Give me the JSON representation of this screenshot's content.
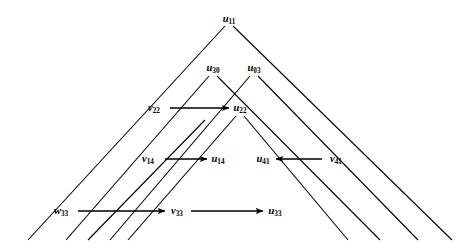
{
  "figure": {
    "type": "lattice-diagram",
    "background": "#ffffff",
    "stroke": "#000000",
    "width": 468,
    "height": 248
  },
  "nodes": [
    {
      "id": "u11",
      "base": "u",
      "sub": "11",
      "x": 229,
      "y": 19,
      "anchor": "center"
    },
    {
      "id": "u30",
      "base": "u",
      "sub": "30",
      "x": 213,
      "y": 68,
      "anchor": "center"
    },
    {
      "id": "u03",
      "base": "u",
      "sub": "03",
      "x": 254,
      "y": 68,
      "anchor": "center"
    },
    {
      "id": "v22",
      "base": "v",
      "sub": "22",
      "x": 154,
      "y": 108,
      "anchor": "center"
    },
    {
      "id": "u22",
      "base": "u",
      "sub": "22",
      "x": 240,
      "y": 108,
      "anchor": "center"
    },
    {
      "id": "v14",
      "base": "v",
      "sub": "14",
      "x": 148,
      "y": 159,
      "anchor": "center"
    },
    {
      "id": "u14",
      "base": "u",
      "sub": "14",
      "x": 218,
      "y": 159,
      "anchor": "center"
    },
    {
      "id": "u41",
      "base": "u",
      "sub": "41",
      "x": 263,
      "y": 159,
      "anchor": "center"
    },
    {
      "id": "v41",
      "base": "v",
      "sub": "41",
      "x": 336,
      "y": 159,
      "anchor": "center"
    },
    {
      "id": "w33",
      "base": "w",
      "sub": "33",
      "x": 61,
      "y": 211,
      "anchor": "center"
    },
    {
      "id": "v33",
      "base": "v",
      "sub": "33",
      "x": 177,
      "y": 211,
      "anchor": "center"
    },
    {
      "id": "u33",
      "base": "u",
      "sub": "33",
      "x": 275,
      "y": 211,
      "anchor": "center"
    }
  ],
  "arrows": [
    {
      "id": "v22-to-u22",
      "from": "v22",
      "to": "u22",
      "x1": 170,
      "y1": 108,
      "x2": 229,
      "y2": 108,
      "direction": "right"
    },
    {
      "id": "v14-to-u14",
      "from": "v14",
      "to": "u14",
      "x1": 165,
      "y1": 159,
      "x2": 207,
      "y2": 159,
      "direction": "right"
    },
    {
      "id": "v41-to-u41",
      "from": "v41",
      "to": "u41",
      "x1": 322,
      "y1": 159,
      "x2": 276,
      "y2": 159,
      "direction": "left"
    },
    {
      "id": "w33-to-v33",
      "from": "w33",
      "to": "v33",
      "x1": 78,
      "y1": 211,
      "x2": 165,
      "y2": 211,
      "direction": "right"
    },
    {
      "id": "v33-to-u33",
      "from": "v33",
      "to": "u33",
      "x1": 191,
      "y1": 211,
      "x2": 263,
      "y2": 211,
      "direction": "right"
    }
  ],
  "lines": [
    {
      "id": "apex-left-outer",
      "x1": 225,
      "y1": 26,
      "x2": 28,
      "y2": 240
    },
    {
      "id": "apex-right-outer",
      "x1": 233,
      "y1": 26,
      "x2": 452,
      "y2": 240
    },
    {
      "id": "u30-left",
      "x1": 209,
      "y1": 76,
      "x2": 66,
      "y2": 240
    },
    {
      "id": "u30-right",
      "x1": 217,
      "y1": 76,
      "x2": 380,
      "y2": 240
    },
    {
      "id": "u03-left",
      "x1": 250,
      "y1": 76,
      "x2": 110,
      "y2": 240
    },
    {
      "id": "u03-right",
      "x1": 258,
      "y1": 76,
      "x2": 418,
      "y2": 240
    },
    {
      "id": "u22-left",
      "x1": 236,
      "y1": 116,
      "x2": 128,
      "y2": 240
    },
    {
      "id": "u22-right",
      "x1": 244,
      "y1": 116,
      "x2": 348,
      "y2": 240
    },
    {
      "id": "inner-left-extra",
      "x1": 205,
      "y1": 120,
      "x2": 88,
      "y2": 240
    }
  ],
  "meta": {
    "arrow_head_length": 7,
    "arrow_head_width": 5,
    "line_width": 1.1
  }
}
